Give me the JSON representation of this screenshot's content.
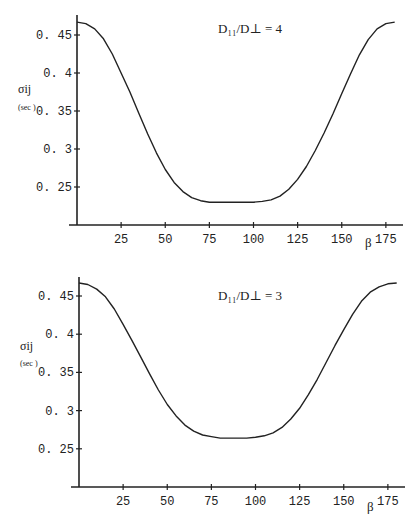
{
  "chart_data": [
    {
      "type": "line",
      "title": "D11/D⊥ = 4",
      "annotation": "D₁₁/D⊥ = 4",
      "xlabel": "β",
      "ylabel": "σij",
      "ylabel_unit": "(sec )",
      "xlim": [
        0,
        185
      ],
      "ylim": [
        0.2,
        0.475
      ],
      "xticks": [
        25,
        50,
        75,
        100,
        125,
        150,
        175
      ],
      "yticks": [
        0.25,
        0.3,
        0.35,
        0.4,
        0.45
      ],
      "ytick_labels": [
        "0. 25",
        "0. 3",
        "0. 35",
        "0. 4",
        "0. 45"
      ],
      "grid": false,
      "x": [
        0,
        5,
        10,
        15,
        20,
        25,
        30,
        35,
        40,
        45,
        50,
        55,
        60,
        65,
        70,
        75,
        80,
        85,
        90,
        95,
        100,
        105,
        110,
        115,
        120,
        125,
        130,
        135,
        140,
        145,
        150,
        155,
        160,
        165,
        170,
        175,
        180
      ],
      "series": [
        {
          "name": "D11/D⊥ = 4",
          "values": [
            0.467,
            0.465,
            0.458,
            0.445,
            0.425,
            0.4,
            0.375,
            0.347,
            0.32,
            0.295,
            0.273,
            0.256,
            0.244,
            0.236,
            0.232,
            0.23,
            0.23,
            0.23,
            0.23,
            0.23,
            0.23,
            0.231,
            0.233,
            0.238,
            0.247,
            0.26,
            0.277,
            0.298,
            0.321,
            0.346,
            0.373,
            0.399,
            0.424,
            0.444,
            0.458,
            0.465,
            0.467
          ]
        }
      ]
    },
    {
      "type": "line",
      "title": "D11/D⊥ = 3",
      "annotation": "D₁₁/D⊥ = 3",
      "xlabel": "β",
      "ylabel": "σij",
      "ylabel_unit": "(sec )",
      "xlim": [
        0,
        185
      ],
      "ylim": [
        0.2,
        0.475
      ],
      "xticks": [
        25,
        50,
        75,
        100,
        125,
        150,
        175
      ],
      "yticks": [
        0.25,
        0.3,
        0.35,
        0.4,
        0.45
      ],
      "ytick_labels": [
        "0. 25",
        "0. 3",
        "0. 35",
        "0. 4",
        "0. 45"
      ],
      "grid": false,
      "x": [
        0,
        5,
        10,
        15,
        20,
        25,
        30,
        35,
        40,
        45,
        50,
        55,
        60,
        65,
        70,
        75,
        80,
        85,
        90,
        95,
        100,
        105,
        110,
        115,
        120,
        125,
        130,
        135,
        140,
        145,
        150,
        155,
        160,
        165,
        170,
        175,
        180
      ],
      "series": [
        {
          "name": "D11/D⊥ = 3",
          "values": [
            0.467,
            0.465,
            0.459,
            0.449,
            0.433,
            0.413,
            0.392,
            0.37,
            0.348,
            0.327,
            0.308,
            0.293,
            0.281,
            0.273,
            0.268,
            0.266,
            0.264,
            0.264,
            0.264,
            0.264,
            0.265,
            0.267,
            0.271,
            0.278,
            0.289,
            0.303,
            0.321,
            0.341,
            0.363,
            0.385,
            0.406,
            0.426,
            0.443,
            0.455,
            0.462,
            0.466,
            0.467
          ]
        }
      ]
    }
  ]
}
